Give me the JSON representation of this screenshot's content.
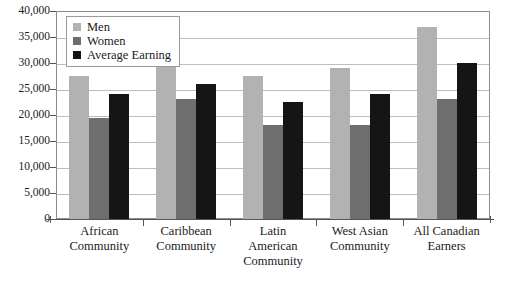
{
  "chart_data": {
    "type": "bar",
    "title": "",
    "xlabel": "",
    "ylabel": "",
    "ylim": [
      0,
      40000
    ],
    "ytick_step": 5000,
    "grid": true,
    "legend_position": "top-left",
    "categories": [
      "African Community",
      "Caribbean Community",
      "Latin American Community",
      "West Asian Community",
      "All Canadian Earners"
    ],
    "category_lines": [
      [
        "African",
        "Community"
      ],
      [
        "Caribbean",
        "Community"
      ],
      [
        "Latin",
        "American",
        "Community"
      ],
      [
        "West Asian",
        "Community"
      ],
      [
        "All Canadian",
        "Earners"
      ]
    ],
    "ytick_labels": [
      "40,000",
      "35,000",
      "30,000",
      "25,000",
      "20,000",
      "15,000",
      "10,000",
      "5,000",
      "0"
    ],
    "ytick_values": [
      40000,
      35000,
      30000,
      25000,
      20000,
      15000,
      10000,
      5000,
      0
    ],
    "series": [
      {
        "name": "Men",
        "color": "#b2b2b2",
        "values": [
          27500,
          30000,
          27500,
          29000,
          37000
        ]
      },
      {
        "name": "Women",
        "color": "#6e6e6e",
        "values": [
          19500,
          23000,
          18000,
          18000,
          23000
        ]
      },
      {
        "name": "Average Earning",
        "color": "#151515",
        "values": [
          24000,
          26000,
          22500,
          24000,
          30000
        ]
      }
    ]
  },
  "legend": {
    "items": [
      {
        "label": "Men",
        "color": "#b2b2b2"
      },
      {
        "label": "Women",
        "color": "#6e6e6e"
      },
      {
        "label": "Average Earning",
        "color": "#151515"
      }
    ]
  }
}
